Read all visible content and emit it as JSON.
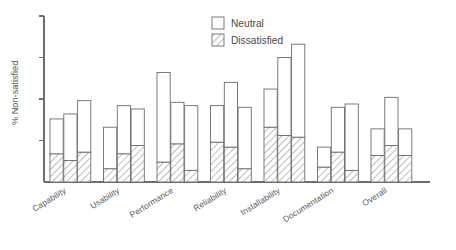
{
  "chart_data": {
    "type": "bar",
    "title": "",
    "subtitle": "",
    "xlabel": "",
    "ylabel": "% Non-satisfied",
    "stacked": true,
    "grouped": true,
    "grid": false,
    "legend_position": "top-right",
    "ylim": [
      0,
      100
    ],
    "yticks": [
      25,
      50,
      75,
      100
    ],
    "ytick_labels": [
      "",
      "",
      "",
      ""
    ],
    "categories": [
      "Capability",
      "Usability",
      "Performance",
      "Reliability",
      "Installability",
      "Documentation",
      "Overall"
    ],
    "bars_per_category": 3,
    "stack_order": [
      "Dissatisfied",
      "Neutral"
    ],
    "series": [
      {
        "name": "Dissatisfied",
        "fill": "hatch-diagonal",
        "values": [
          [
            17,
            13,
            18
          ],
          [
            8,
            17,
            22
          ],
          [
            12,
            23,
            7
          ],
          [
            24,
            21,
            8
          ],
          [
            33,
            28,
            27
          ],
          [
            9,
            18,
            7
          ],
          [
            16,
            22,
            16
          ]
        ]
      },
      {
        "name": "Neutral",
        "fill": "white",
        "values": [
          [
            21,
            28,
            31
          ],
          [
            25,
            29,
            22
          ],
          [
            54,
            25,
            39
          ],
          [
            22,
            39,
            37
          ],
          [
            23,
            47,
            56
          ],
          [
            12,
            27,
            40
          ],
          [
            16,
            29,
            16
          ]
        ]
      }
    ],
    "totals": [
      [
        38,
        41,
        49
      ],
      [
        33,
        46,
        44
      ],
      [
        66,
        48,
        46
      ],
      [
        46,
        60,
        45
      ],
      [
        56,
        75,
        83
      ],
      [
        21,
        45,
        47
      ],
      [
        32,
        51,
        32
      ]
    ]
  },
  "legend": {
    "items": [
      {
        "label": "Neutral",
        "swatch": "white-square"
      },
      {
        "label": "Dissatisfied",
        "swatch": "hatched-square"
      }
    ]
  },
  "axes": {
    "y_axis_label": "% Non-satisfied",
    "tick_count": 4
  },
  "colors": {
    "line": "#6d6d6d",
    "text": "#5a5a5a",
    "legend_text": "#4a4a4a",
    "background": "#ffffff",
    "bar_fill_neutral": "#ffffff",
    "bar_hatch_stroke": "#6d6d6d"
  }
}
